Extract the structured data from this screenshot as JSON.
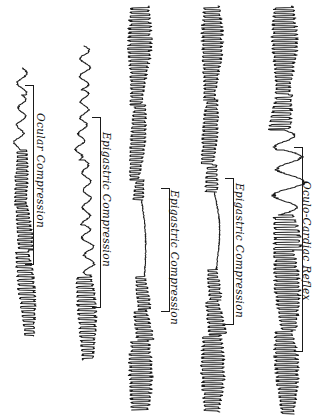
{
  "figure": {
    "orientation": "rotated-90",
    "background_color": "#ffffff",
    "ink_color": "#1a1a1a",
    "width": 325,
    "height": 417
  },
  "chart_data": {
    "type": "line",
    "subtitle": "Kymograph tracings of vasomotor / pulse response to compression manoeuvres",
    "orientation": "vertical traces, time axis runs top-to-bottom; labels rotated 90 degrees",
    "xlabel": "",
    "ylabel": "",
    "grid": false,
    "legend_position": "none",
    "axis_ticks_visible": false,
    "series": [
      {
        "name": "trace-1",
        "label": "Ocular Compression",
        "baseline_x": 22,
        "y_start": 68,
        "y_end": 336,
        "amplitude_small": 4,
        "amplitude_large": 9,
        "segments": [
          {
            "from": 68,
            "to": 95,
            "mode": "oscillation",
            "amp": 5,
            "period": 7,
            "drift": -3
          },
          {
            "from": 95,
            "to": 150,
            "mode": "oscillation",
            "amp": 4,
            "period": 6,
            "drift": -5
          },
          {
            "from": 150,
            "to": 205,
            "mode": "dense",
            "amp": 6,
            "period": 4,
            "drift": -4
          },
          {
            "from": 205,
            "to": 250,
            "mode": "dense",
            "amp": 7,
            "period": 4,
            "drift": 2
          },
          {
            "from": 250,
            "to": 336,
            "mode": "dense",
            "amp": 8,
            "period": 4.5,
            "drift": 6
          }
        ]
      },
      {
        "name": "trace-2",
        "label": "Epigastric Compression",
        "baseline_x": 84,
        "y_start": 46,
        "y_end": 360,
        "amplitude_small": 4,
        "amplitude_large": 10,
        "segments": [
          {
            "from": 46,
            "to": 90,
            "mode": "oscillation",
            "amp": 5,
            "period": 6,
            "drift": -2
          },
          {
            "from": 90,
            "to": 160,
            "mode": "oscillation",
            "amp": 4,
            "period": 5.5,
            "drift": -4
          },
          {
            "from": 160,
            "to": 225,
            "mode": "oscillation",
            "amp": 4,
            "period": 6,
            "drift": 3
          },
          {
            "from": 225,
            "to": 275,
            "mode": "oscillation",
            "amp": 5,
            "period": 6,
            "drift": 5
          },
          {
            "from": 275,
            "to": 360,
            "mode": "dense",
            "amp": 9,
            "period": 4.5,
            "drift": 2
          }
        ]
      },
      {
        "name": "trace-3",
        "label": "Epigastric Compression",
        "baseline_x": 140,
        "y_start": 6,
        "y_end": 410,
        "amplitude_small": 3,
        "amplitude_large": 11,
        "segments": [
          {
            "from": 6,
            "to": 105,
            "mode": "dense",
            "amp": 11,
            "period": 4,
            "drift": -5
          },
          {
            "from": 105,
            "to": 180,
            "mode": "dense",
            "amp": 7,
            "period": 4,
            "drift": -8
          },
          {
            "from": 180,
            "to": 200,
            "mode": "dense",
            "amp": 5,
            "period": 4,
            "drift": -3
          },
          {
            "from": 200,
            "to": 275,
            "mode": "smooth",
            "amp": 2,
            "period": 22,
            "drift": 4
          },
          {
            "from": 275,
            "to": 310,
            "mode": "dense",
            "amp": 6,
            "period": 4,
            "drift": 3
          },
          {
            "from": 310,
            "to": 340,
            "mode": "dense",
            "amp": 8,
            "period": 4,
            "drift": 4
          },
          {
            "from": 340,
            "to": 410,
            "mode": "dense",
            "amp": 11,
            "period": 4,
            "drift": -2
          }
        ]
      },
      {
        "name": "trace-4",
        "label": "Epigastric Compression",
        "baseline_x": 212,
        "y_start": 6,
        "y_end": 412,
        "amplitude_small": 3,
        "amplitude_large": 11,
        "segments": [
          {
            "from": 6,
            "to": 100,
            "mode": "dense",
            "amp": 10,
            "period": 4,
            "drift": -4
          },
          {
            "from": 100,
            "to": 165,
            "mode": "dense",
            "amp": 7,
            "period": 4,
            "drift": -7
          },
          {
            "from": 165,
            "to": 192,
            "mode": "dense",
            "amp": 6,
            "period": 4.5,
            "drift": -2
          },
          {
            "from": 192,
            "to": 268,
            "mode": "smooth",
            "amp": 3,
            "period": 20,
            "drift": 5
          },
          {
            "from": 268,
            "to": 300,
            "mode": "dense",
            "amp": 6,
            "period": 4,
            "drift": 2
          },
          {
            "from": 300,
            "to": 335,
            "mode": "dense",
            "amp": 8,
            "period": 4,
            "drift": 4
          },
          {
            "from": 335,
            "to": 412,
            "mode": "dense",
            "amp": 11,
            "period": 4,
            "drift": -2
          }
        ]
      },
      {
        "name": "trace-5",
        "label": "Oculo-Cardiac Reflex",
        "baseline_x": 284,
        "y_start": 6,
        "y_end": 414,
        "amplitude_small": 5,
        "amplitude_large": 14,
        "segments": [
          {
            "from": 6,
            "to": 95,
            "mode": "dense",
            "amp": 12,
            "period": 4,
            "drift": -3
          },
          {
            "from": 95,
            "to": 130,
            "mode": "dense",
            "amp": 10,
            "period": 4.5,
            "drift": -6
          },
          {
            "from": 130,
            "to": 150,
            "mode": "oscillation",
            "amp": 10,
            "period": 8,
            "drift": -4
          },
          {
            "from": 150,
            "to": 215,
            "mode": "oscillation",
            "amp": 14,
            "period": 9,
            "drift": 3
          },
          {
            "from": 215,
            "to": 250,
            "mode": "dense",
            "amp": 13,
            "period": 5,
            "drift": 2
          },
          {
            "from": 250,
            "to": 330,
            "mode": "dense",
            "amp": 12,
            "period": 4,
            "drift": 3
          },
          {
            "from": 330,
            "to": 414,
            "mode": "dense",
            "amp": 11,
            "period": 4,
            "drift": 2
          }
        ]
      }
    ],
    "brackets": [
      {
        "name": "bracket-1",
        "for_series": "trace-1",
        "x": 33,
        "y_top": 85,
        "y_bottom": 265,
        "tick_length": 9
      },
      {
        "name": "bracket-2",
        "for_series": "trace-2",
        "x": 100,
        "y_top": 117,
        "y_bottom": 308,
        "tick_length": 9
      },
      {
        "name": "bracket-3",
        "for_series": "trace-3",
        "x": 169,
        "y_top": 188,
        "y_bottom": 312,
        "tick_length": 9
      },
      {
        "name": "bracket-4",
        "for_series": "trace-4",
        "x": 233,
        "y_top": 178,
        "y_bottom": 325,
        "tick_length": 9
      },
      {
        "name": "bracket-5",
        "for_series": "trace-5",
        "x": 302,
        "y_top": 147,
        "y_bottom": 352,
        "tick_length": 9
      }
    ],
    "annotations": [
      {
        "name": "label-1",
        "text": "Ocular Compression",
        "x": 47,
        "y": 113,
        "rotation": 90
      },
      {
        "name": "label-2",
        "text": "Epigastric Compression",
        "x": 113,
        "y": 132,
        "rotation": 90
      },
      {
        "name": "label-3",
        "text": "Epigastric Compression",
        "x": 181,
        "y": 190,
        "rotation": 90
      },
      {
        "name": "label-4",
        "text": "Epigastric Compression",
        "x": 246,
        "y": 183,
        "rotation": 90
      },
      {
        "name": "label-5",
        "text": "Oculo-Cardiac Reflex",
        "x": 313,
        "y": 181,
        "rotation": 90
      }
    ]
  }
}
